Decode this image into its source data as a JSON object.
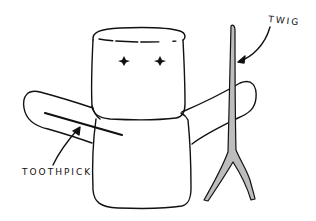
{
  "figure": {
    "colors": {
      "ink": "#111111",
      "background": "#ffffff",
      "twig_fill": "#bdbdbd"
    },
    "labels": {
      "twig": "TWIG",
      "toothpick": "TOOTHPICK"
    },
    "parts": [
      {
        "name": "head-marshmallow"
      },
      {
        "name": "body-marshmallow"
      },
      {
        "name": "left-arm-marshmallow"
      },
      {
        "name": "right-arm-marshmallow"
      },
      {
        "name": "eyes",
        "count": 2
      },
      {
        "name": "toothpick"
      },
      {
        "name": "twig"
      }
    ]
  }
}
